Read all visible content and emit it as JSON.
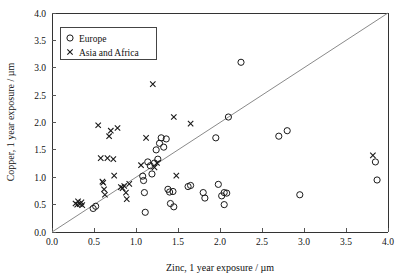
{
  "chart_data": {
    "type": "scatter",
    "title": "",
    "xlabel": "Zinc, 1 year exposure / µm",
    "ylabel": "Copper, 1 year exposure / µm",
    "xlim": [
      0.0,
      4.0
    ],
    "ylim": [
      0.0,
      4.0
    ],
    "xticks": [
      "0.0",
      "0.5",
      "1.0",
      "1.5",
      "2.0",
      "2.5",
      "3.0",
      "3.5",
      "4.0"
    ],
    "yticks": [
      "0.0",
      "0.5",
      "1.0",
      "1.5",
      "2.0",
      "2.5",
      "3.0",
      "3.5",
      "4.0"
    ],
    "xtick_values": [
      0.0,
      0.5,
      1.0,
      1.5,
      2.0,
      2.5,
      3.0,
      3.5,
      4.0
    ],
    "ytick_values": [
      0.0,
      0.5,
      1.0,
      1.5,
      2.0,
      2.5,
      3.0,
      3.5,
      4.0
    ],
    "grid": false,
    "legend_position": "top-left",
    "annotations": [
      {
        "name": "identity-line",
        "type": "line",
        "from": [
          0.0,
          0.0
        ],
        "to": [
          4.0,
          4.0
        ],
        "color": "#8a8a8a"
      }
    ],
    "series": [
      {
        "name": "Europe",
        "marker": "circle",
        "color": "#1a1a1a",
        "points": [
          [
            0.49,
            0.43
          ],
          [
            0.52,
            0.47
          ],
          [
            1.08,
            1.02
          ],
          [
            1.09,
            0.94
          ],
          [
            1.1,
            0.72
          ],
          [
            1.11,
            0.36
          ],
          [
            1.14,
            1.28
          ],
          [
            1.17,
            1.21
          ],
          [
            1.19,
            1.06
          ],
          [
            1.22,
            1.26
          ],
          [
            1.24,
            1.5
          ],
          [
            1.26,
            1.33
          ],
          [
            1.28,
            1.62
          ],
          [
            1.3,
            1.72
          ],
          [
            1.33,
            1.55
          ],
          [
            1.36,
            1.7
          ],
          [
            1.38,
            0.78
          ],
          [
            1.4,
            0.73
          ],
          [
            1.41,
            0.52
          ],
          [
            1.44,
            0.74
          ],
          [
            1.45,
            0.46
          ],
          [
            1.62,
            0.83
          ],
          [
            1.65,
            0.85
          ],
          [
            1.8,
            0.72
          ],
          [
            1.82,
            0.62
          ],
          [
            1.95,
            1.72
          ],
          [
            1.98,
            0.87
          ],
          [
            2.02,
            0.66
          ],
          [
            2.05,
            0.72
          ],
          [
            2.08,
            0.71
          ],
          [
            2.05,
            0.5
          ],
          [
            2.1,
            2.1
          ],
          [
            2.25,
            3.1
          ],
          [
            2.7,
            1.75
          ],
          [
            2.8,
            1.85
          ],
          [
            2.95,
            0.68
          ],
          [
            3.85,
            1.28
          ],
          [
            3.87,
            0.95
          ]
        ]
      },
      {
        "name": "Asia and Africa",
        "marker": "cross",
        "color": "#1a1a1a",
        "points": [
          [
            0.28,
            0.52
          ],
          [
            0.3,
            0.5
          ],
          [
            0.31,
            0.56
          ],
          [
            0.33,
            0.51
          ],
          [
            0.35,
            0.54
          ],
          [
            0.36,
            0.49
          ],
          [
            0.55,
            1.95
          ],
          [
            0.58,
            1.35
          ],
          [
            0.6,
            0.92
          ],
          [
            0.61,
            0.9
          ],
          [
            0.62,
            0.78
          ],
          [
            0.63,
            0.68
          ],
          [
            0.66,
            1.35
          ],
          [
            0.68,
            1.75
          ],
          [
            0.7,
            1.85
          ],
          [
            0.73,
            1.33
          ],
          [
            0.74,
            1.03
          ],
          [
            0.78,
            1.9
          ],
          [
            0.82,
            0.82
          ],
          [
            0.84,
            0.8
          ],
          [
            0.86,
            0.84
          ],
          [
            0.88,
            0.72
          ],
          [
            0.89,
            0.6
          ],
          [
            0.92,
            0.88
          ],
          [
            1.06,
            1.22
          ],
          [
            1.12,
            1.72
          ],
          [
            1.2,
            2.7
          ],
          [
            1.22,
            1.18
          ],
          [
            1.25,
            1.26
          ],
          [
            1.45,
            2.1
          ],
          [
            1.48,
            1.03
          ],
          [
            1.65,
            1.98
          ],
          [
            3.82,
            1.4
          ]
        ]
      }
    ]
  },
  "legend": {
    "entries": [
      {
        "label": "Europe",
        "marker": "circle"
      },
      {
        "label": "Asia and Africa",
        "marker": "cross"
      }
    ]
  }
}
